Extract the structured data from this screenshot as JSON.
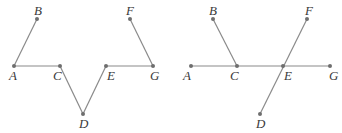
{
  "figures": [
    {
      "name": "left-figure",
      "points": {
        "A": {
          "x": 14,
          "y": 66,
          "lx": 9,
          "ly": 80
        },
        "B": {
          "x": 37,
          "y": 19,
          "lx": 34,
          "ly": 15
        },
        "C": {
          "x": 60,
          "y": 66,
          "lx": 53,
          "ly": 80
        },
        "D": {
          "x": 83,
          "y": 114,
          "lx": 79,
          "ly": 128
        },
        "E": {
          "x": 106,
          "y": 66,
          "lx": 107,
          "ly": 80
        },
        "F": {
          "x": 130,
          "y": 19,
          "lx": 126,
          "ly": 15
        },
        "G": {
          "x": 153,
          "y": 66,
          "lx": 150,
          "ly": 80
        }
      },
      "segments": [
        [
          "A",
          "B"
        ],
        [
          "A",
          "C"
        ],
        [
          "C",
          "D"
        ],
        [
          "D",
          "E"
        ],
        [
          "E",
          "G"
        ],
        [
          "G",
          "F"
        ]
      ]
    },
    {
      "name": "right-figure",
      "points": {
        "A": {
          "x": 191,
          "y": 66,
          "lx": 183,
          "ly": 80
        },
        "B": {
          "x": 213,
          "y": 19,
          "lx": 209,
          "ly": 15
        },
        "C": {
          "x": 237,
          "y": 66,
          "lx": 230,
          "ly": 80
        },
        "D": {
          "x": 260,
          "y": 114,
          "lx": 256,
          "ly": 128
        },
        "E": {
          "x": 283,
          "y": 66,
          "lx": 284,
          "ly": 80
        },
        "F": {
          "x": 307,
          "y": 19,
          "lx": 305,
          "ly": 15
        },
        "G": {
          "x": 330,
          "y": 66,
          "lx": 329,
          "ly": 80
        }
      },
      "segments": [
        [
          "A",
          "G"
        ],
        [
          "B",
          "C"
        ],
        [
          "D",
          "F"
        ]
      ]
    }
  ],
  "colors": {
    "line": "#8a8a8a",
    "point": "#6e6e6e",
    "label": "#3a3a3a"
  }
}
